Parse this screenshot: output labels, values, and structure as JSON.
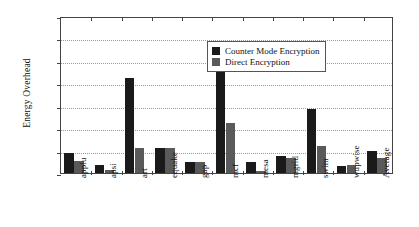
{
  "chart_data": {
    "type": "bar",
    "title": "",
    "xlabel": "",
    "ylabel": "Energy Overhead",
    "ylim": [
      0,
      14
    ],
    "ytick_labels": [
      "0%",
      "2%",
      "4%",
      "6%",
      "8%",
      "10%",
      "12%",
      "14%"
    ],
    "ytick_values": [
      0,
      2,
      4,
      6,
      8,
      10,
      12,
      14
    ],
    "grid": true,
    "legend_position": "upper right",
    "categories": [
      "applu",
      "apsi",
      "art",
      "equake",
      "gap",
      "mcf",
      "mesa",
      "mgrid",
      "swim",
      "wupwise",
      "Average"
    ],
    "series": [
      {
        "name": "Counter Mode Encryption",
        "color": "#1a1a1a",
        "values": [
          1.8,
          0.75,
          8.5,
          2.2,
          0.95,
          11.7,
          1.0,
          1.5,
          5.7,
          0.65,
          2.0
        ]
      },
      {
        "name": "Direct Encryption",
        "color": "#5a5a5a",
        "values": [
          1.1,
          0.25,
          2.2,
          2.2,
          0.95,
          4.5,
          0.15,
          1.3,
          2.4,
          0.7,
          1.3
        ]
      }
    ]
  }
}
